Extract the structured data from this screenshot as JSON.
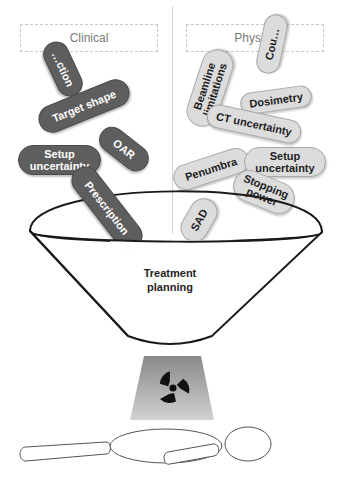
{
  "headers": {
    "clinical": "Clinical",
    "physics": "Physics"
  },
  "clinical_pills": [
    {
      "label": "…ction"
    },
    {
      "label": "Target shape"
    },
    {
      "label": "OAR"
    },
    {
      "label": "Setup uncertainty"
    },
    {
      "label": "Prescription"
    }
  ],
  "physics_pills": [
    {
      "label": "Cou…"
    },
    {
      "label": "Beamline limitations"
    },
    {
      "label": "Dosimetry"
    },
    {
      "label": "CT uncertainty"
    },
    {
      "label": "Penumbra"
    },
    {
      "label": "Setup uncertainty"
    },
    {
      "label": "Stopping power"
    },
    {
      "label": "SAD"
    }
  ],
  "funnel": {
    "label_line1": "Treatment",
    "label_line2": "planning"
  },
  "beam": {
    "icon": "radiation-trefoil-icon"
  },
  "patient": {
    "icon": "patient-outline-icon"
  },
  "colors": {
    "clinical_pill": "#5e5e5e",
    "physics_pill": "#dcdcdc",
    "funnel_stroke": "#1a1a1a",
    "beam_top": "#8a8a8a",
    "beam_bottom": "#d0d0d0"
  }
}
